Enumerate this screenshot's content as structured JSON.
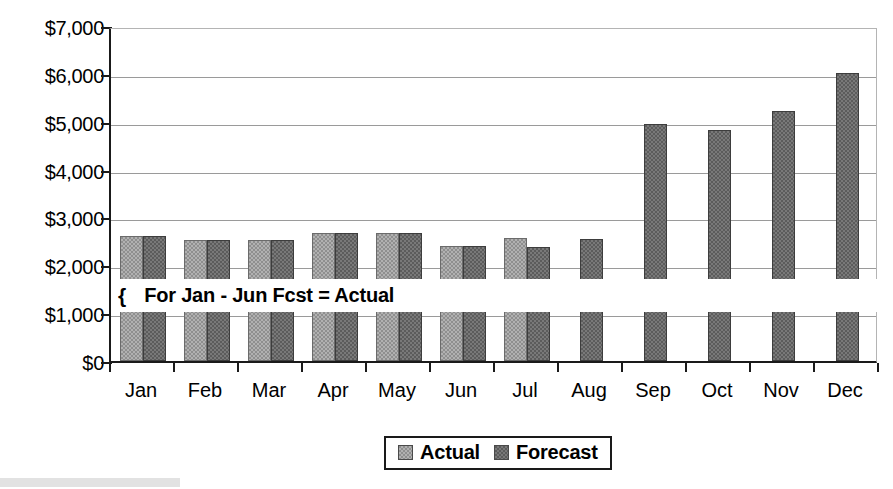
{
  "chart_data": {
    "type": "bar",
    "title": "",
    "xlabel": "",
    "ylabel": "",
    "categories": [
      "Jan",
      "Feb",
      "Mar",
      "Apr",
      "May",
      "Jun",
      "Jul",
      "Aug",
      "Sep",
      "Oct",
      "Nov",
      "Dec"
    ],
    "series": [
      {
        "name": "Actual",
        "color": "#8f8f8f",
        "values": [
          2620,
          2530,
          2520,
          2680,
          2680,
          2400,
          2575,
          null,
          null,
          null,
          null,
          null
        ]
      },
      {
        "name": "Forecast",
        "color": "#5c5c5c",
        "values": [
          2620,
          2530,
          2520,
          2680,
          2680,
          2400,
          2380,
          2550,
          4950,
          4820,
          5220,
          6010
        ]
      }
    ],
    "ylim": [
      0,
      7000
    ],
    "ytick_values": [
      0,
      1000,
      2000,
      3000,
      4000,
      5000,
      6000,
      7000
    ],
    "ytick_labels": [
      "$0",
      "$1,000",
      "$2,000",
      "$3,000",
      "$4,000",
      "$5,000",
      "$6,000",
      "$7,000"
    ],
    "grid": true,
    "legend_position": "bottom",
    "annotations": [
      {
        "brace": "{",
        "text": "For Jan - Jun Fcst = Actual",
        "value_position": 1500
      }
    ]
  },
  "legend": {
    "items": [
      {
        "label": "Actual",
        "swatch": "legend-swatch-actual"
      },
      {
        "label": "Forecast",
        "swatch": "legend-swatch-forecast"
      }
    ]
  }
}
